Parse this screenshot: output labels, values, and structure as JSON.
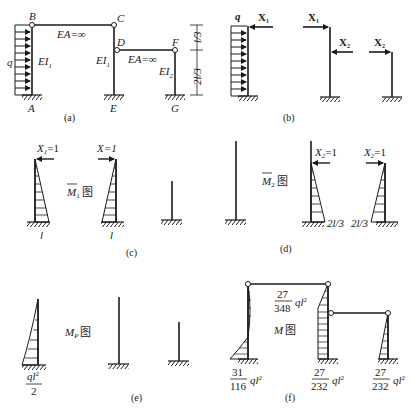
{
  "figure": {
    "panels": {
      "a": {
        "caption": "(a)",
        "nodes": {
          "A": "A",
          "B": "B",
          "C": "C",
          "D": "D",
          "E": "E",
          "F": "F",
          "G": "G"
        },
        "load": "q",
        "beam1_label": "EA=∞",
        "beam2_label": "EA=∞",
        "col_AB_label": "EI",
        "col_AB_sub": "1",
        "col_CE_label": "EI",
        "col_CE_sub": "1",
        "col_FG_label": "EI",
        "col_FG_sub": "2",
        "dim_top": "l/3",
        "dim_bottom": "2l/3"
      },
      "b": {
        "caption": "(b)",
        "load": "q",
        "x1_a": "X",
        "x1_a_sub": "1",
        "x1_b": "X",
        "x1_b_sub": "1",
        "x2_a": "X",
        "x2_a_sub": "2",
        "x2_b": "X",
        "x2_b_sub": "2"
      },
      "c": {
        "caption": "(c)",
        "title_main": "M",
        "title_sub": "1",
        "title_suffix": "图",
        "load_left": "X",
        "load_left_sub": "1",
        "load_left_val": "=1",
        "load_mid": "X=1",
        "value_left": "l",
        "value_mid": "l"
      },
      "d": {
        "caption": "(d)",
        "title_main": "M",
        "title_sub": "2",
        "title_suffix": "图",
        "load_a": "X",
        "load_a_sub": "2",
        "load_a_val": "=1",
        "load_b": "X",
        "load_b_sub": "2",
        "load_b_val": "=1",
        "value_a": "2l/3",
        "value_b": "2l/3"
      },
      "e": {
        "caption": "(e)",
        "title_main": "M",
        "title_sub": "P",
        "title_suffix": "图",
        "value_num": "ql",
        "value_exp": "2",
        "value_den": "2"
      },
      "f": {
        "caption": "(f)",
        "title_main": "M",
        "title_suffix": "图",
        "val_top_num": "27",
        "val_top_den": "348",
        "val_base_A_num": "31",
        "val_base_A_den": "116",
        "val_base_E_num": "27",
        "val_base_E_den": "232",
        "val_base_G_num": "27",
        "val_base_G_den": "232",
        "ql2": "ql",
        "exp": "2"
      }
    }
  }
}
